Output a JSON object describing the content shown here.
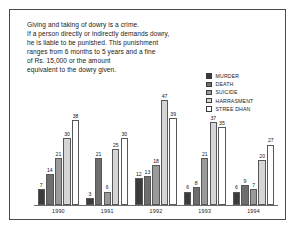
{
  "figure": {
    "caption": "Giving and taking of dowry is a crime.\nIf a person directly or indirectly demands dowry,\nhe is liable to be punished. This punishment\nranges from 6 months to 5 years and a fine\nof Rs. 15,000  or the amount\nequivalent to the dowry given."
  },
  "chart_data": {
    "type": "bar",
    "title": "",
    "xlabel": "",
    "ylabel": "",
    "ylim": [
      0,
      50
    ],
    "grid": false,
    "legend_position": "top-right",
    "categories": [
      "1990",
      "1991",
      "1992",
      "1993",
      "1994"
    ],
    "series": [
      {
        "name": "MURDER",
        "color": "#3b3b3b",
        "values": [
          7,
          3,
          12,
          6,
          6
        ]
      },
      {
        "name": "DEATH",
        "color": "#6e6e6e",
        "values": [
          14,
          21,
          13,
          8,
          9
        ]
      },
      {
        "name": "SUICIDE",
        "color": "#9a9a9a",
        "values": [
          21,
          6,
          18,
          21,
          7
        ]
      },
      {
        "name": "HARRASMENT",
        "color": "#d5d5d5",
        "values": [
          30,
          25,
          47,
          37,
          20
        ]
      },
      {
        "name": "STREE DHAN",
        "color": "#ffffff",
        "values": [
          38,
          30,
          39,
          35,
          27
        ]
      }
    ]
  }
}
